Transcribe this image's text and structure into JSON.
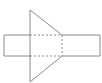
{
  "diagram": {
    "colors": {
      "stroke": "#8a8a8a",
      "background": "#ffffff"
    },
    "rectangle": {
      "x1": 4,
      "y1": 35,
      "x2": 100,
      "y2": 56
    },
    "triangle": {
      "apex_top": [
        30,
        10
      ],
      "apex_bottom": [
        30,
        82
      ],
      "right_top": [
        62,
        35
      ],
      "right_bottom": [
        62,
        56
      ]
    },
    "dotted_square": {
      "x1": 30,
      "y1": 35,
      "x2": 62,
      "y2": 56
    }
  }
}
